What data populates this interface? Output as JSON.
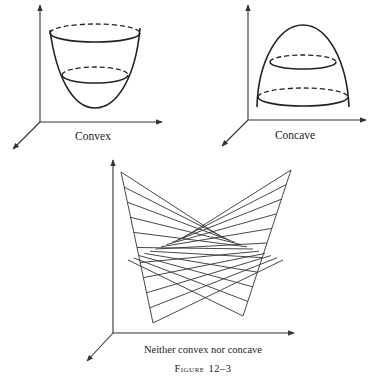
{
  "figure": {
    "caption": "Figure 12–3",
    "caption_prefix": "Figure",
    "caption_number": "12–3",
    "panels": [
      {
        "id": "convex",
        "label": "Convex",
        "shape": "upward bowl (paraboloid) with two horizontal level-set ellipses"
      },
      {
        "id": "concave",
        "label": "Concave",
        "shape": "downward dome with two horizontal level-set ellipses"
      },
      {
        "id": "saddle",
        "label": "Neither convex nor concave",
        "shape": "saddle surface drawn with straight-line rulings"
      }
    ]
  },
  "colors": {
    "background": "#ffffff",
    "ink": "#222222"
  }
}
